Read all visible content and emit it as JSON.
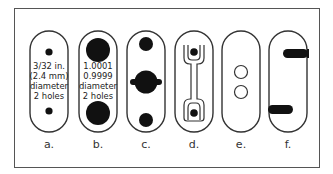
{
  "figure": {
    "panels": [
      {
        "id": "a",
        "label": "a.",
        "text": [
          "3/32 in.",
          "(2.4 mm)",
          "diameter",
          "2 holes"
        ],
        "description": "pill outline with two small solid holes"
      },
      {
        "id": "b",
        "label": "b.",
        "text": [
          "1.0001",
          "0.9999",
          "diameter",
          "2 holes"
        ],
        "description": "pill outline with two large solid holes"
      },
      {
        "id": "c",
        "label": "c.",
        "text": [],
        "description": "pill with two solid holes and central keyed hole"
      },
      {
        "id": "d",
        "label": "d.",
        "text": [],
        "description": "pill with dumbbell slot and two holes"
      },
      {
        "id": "e",
        "label": "e.",
        "text": [],
        "description": "pill with two hollow circles"
      },
      {
        "id": "f",
        "label": "f.",
        "text": [],
        "description": "pill with two offset solid slots on edges"
      }
    ]
  },
  "colors": {
    "stroke": "#333333",
    "fill": "#111111",
    "border": "#555555"
  }
}
